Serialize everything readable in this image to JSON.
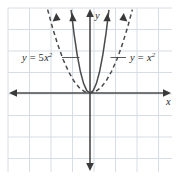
{
  "figure": {
    "background_color": "#ffffff",
    "width": 179,
    "height": 180
  },
  "grid": {
    "color": "#d7dde4",
    "spacing_px": 21.5,
    "visible": true,
    "left_px": 8,
    "top_px": 8,
    "right_px": 172,
    "bottom_px": 172
  },
  "axes": {
    "color": "#4a4a4a",
    "origin": {
      "x_px": 90,
      "y_px": 93
    },
    "x_axis": {
      "label": "x",
      "arrow_left": true,
      "arrow_right": true
    },
    "y_axis": {
      "label": "y",
      "arrow_up": true,
      "arrow_down": true
    }
  },
  "curves": [
    {
      "name": "narrow-parabola",
      "equation": "y = 5x²",
      "coefficient": 5,
      "style": "solid",
      "color": "#4a4a4a",
      "arrows": "up-both-branches"
    },
    {
      "name": "wide-parabola",
      "equation": "y = x²",
      "coefficient": 1,
      "style": "dashed",
      "color": "#4a4a4a",
      "arrows": "up-both-branches"
    }
  ],
  "annotations": {
    "left_label": {
      "y": "y",
      "equals": "=",
      "coefficient": "5",
      "variable": "x",
      "exponent": "2",
      "full_text": "y = 5x²"
    },
    "right_label": {
      "y": "y",
      "equals": "=",
      "variable": "x",
      "exponent": "2",
      "full_text": "y = x²"
    }
  },
  "chart_data": {
    "type": "line",
    "title": "",
    "xlabel": "x",
    "ylabel": "y",
    "grid": true,
    "legend": "inline-annotations",
    "xlim": [
      -3.8,
      3.8
    ],
    "ylim": [
      -3.7,
      3.9
    ],
    "series": [
      {
        "name": "y = 5x²",
        "style": "solid",
        "color": "#4a4a4a",
        "x": [
          -0.88,
          -0.75,
          -0.6,
          -0.45,
          -0.3,
          -0.15,
          0,
          0.15,
          0.3,
          0.45,
          0.6,
          0.75,
          0.88
        ],
        "y": [
          3.87,
          2.81,
          1.8,
          1.01,
          0.45,
          0.11,
          0,
          0.11,
          0.45,
          1.01,
          1.8,
          2.81,
          3.87
        ]
      },
      {
        "name": "y = x²",
        "style": "dashed",
        "color": "#4a4a4a",
        "x": [
          -1.97,
          -1.75,
          -1.5,
          -1.25,
          -1.0,
          -0.75,
          -0.5,
          -0.25,
          0,
          0.25,
          0.5,
          0.75,
          1.0,
          1.25,
          1.5,
          1.75,
          1.97
        ],
        "y": [
          3.88,
          3.06,
          2.25,
          1.56,
          1.0,
          0.56,
          0.25,
          0.06,
          0,
          0.06,
          0.25,
          0.56,
          1.0,
          1.56,
          2.25,
          3.06,
          3.88
        ]
      }
    ]
  }
}
